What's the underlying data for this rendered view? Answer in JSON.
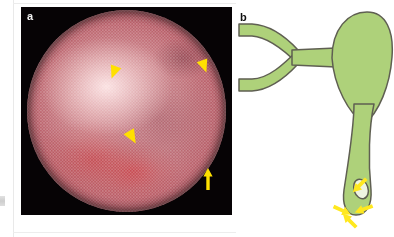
{
  "figure": {
    "type": "two-panel medical figure",
    "background_color": "#ffffff",
    "panels": [
      {
        "id": "a",
        "label": "a",
        "label_color": "#f2f2f2",
        "kind": "endoscopic-photograph",
        "background_color": "#060305",
        "description": "Circular fibre-optic endoscopic view of pink-red mucosa with bright central reflection",
        "annotations": [
          {
            "name": "arrowhead-1",
            "glyph": "arrowhead",
            "color": "#ffe000",
            "x": 93,
            "y": 65,
            "rotation": 200
          },
          {
            "name": "arrowhead-2",
            "glyph": "arrowhead",
            "color": "#ffe000",
            "x": 183,
            "y": 59,
            "rotation": 160
          },
          {
            "name": "arrowhead-3",
            "glyph": "arrowhead",
            "color": "#ffe000",
            "x": 111,
            "y": 130,
            "rotation": 150
          },
          {
            "name": "arrow-1",
            "glyph": "arrow",
            "color": "#ffe000",
            "x": 187,
            "y": 172,
            "rotation": 0
          }
        ]
      },
      {
        "id": "b",
        "label": "b",
        "label_color": "#101010",
        "kind": "anatomical-schematic",
        "background_color": "#ffffff",
        "organ_fill_color": "#aed17a",
        "organ_stroke_color": "#5f5f52",
        "description": "Schematic of biliary tree: hepatic ducts forming a Y, cystic duct, gallbladder and tapering distal duct with a small orifice",
        "parts": [
          "right-hepatic-duct",
          "left-hepatic-duct",
          "common-hepatic-duct",
          "cystic-duct",
          "gallbladder",
          "distal-common-bile-duct",
          "duct-orifice"
        ],
        "annotations": [
          {
            "name": "arrow-upper-right",
            "glyph": "arrow",
            "color": "#ffe81f",
            "x": 362,
            "y": 183,
            "rotation": 225
          },
          {
            "name": "arrow-left",
            "glyph": "arrow",
            "color": "#ffe81f",
            "x": 339,
            "y": 209,
            "rotation": 115
          },
          {
            "name": "arrow-right",
            "glyph": "arrow",
            "color": "#ffe81f",
            "x": 367,
            "y": 208,
            "rotation": 250
          },
          {
            "name": "arrow-bottom",
            "glyph": "arrow",
            "color": "#ffe81f",
            "x": 352,
            "y": 223,
            "rotation": 315
          }
        ]
      }
    ]
  },
  "colors": {
    "marker_yellow": "#ffe000",
    "schematic_yellow": "#ffe81f",
    "organ_green": "#aed17a",
    "organ_outline": "#5f5f52",
    "photo_black": "#060305",
    "page_white": "#ffffff",
    "rule_gray": "#e9e9e9"
  }
}
